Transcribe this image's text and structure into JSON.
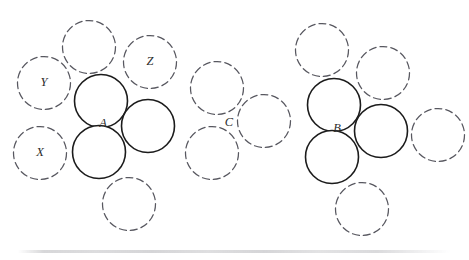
{
  "figure": {
    "canvas": {
      "width": 469,
      "height": 260,
      "background": "#ffffff"
    },
    "style": {
      "solid_stroke_color": "#1c1c1c",
      "solid_stroke_width": 1.6,
      "dashed_stroke_color": "#585860",
      "dashed_stroke_width": 1.25,
      "dash_pattern": "7 4",
      "label_color": "#2b2b2b",
      "label_font_size": 12.5
    },
    "labels": [
      {
        "id": "label-a",
        "text": "A",
        "x": 103,
        "y": 124
      },
      {
        "id": "label-b",
        "text": "B",
        "x": 337,
        "y": 129
      },
      {
        "id": "label-c",
        "text": "C",
        "x": 229,
        "y": 123
      },
      {
        "id": "label-x",
        "text": "X",
        "x": 40,
        "y": 153
      },
      {
        "id": "label-y",
        "text": "Y",
        "x": 44,
        "y": 83
      },
      {
        "id": "label-z",
        "text": "Z",
        "x": 150,
        "y": 62
      }
    ],
    "solid_circles": [
      {
        "id": "solid-a-upper-left",
        "cx": 101,
        "cy": 101,
        "r": 26.5
      },
      {
        "id": "solid-a-right",
        "cx": 148,
        "cy": 126,
        "r": 26.5
      },
      {
        "id": "solid-a-lower-left",
        "cx": 99,
        "cy": 152,
        "r": 26.5
      },
      {
        "id": "solid-b-upper-left",
        "cx": 334,
        "cy": 105,
        "r": 26.5
      },
      {
        "id": "solid-b-right",
        "cx": 381,
        "cy": 131,
        "r": 26.5
      },
      {
        "id": "solid-b-lower-left",
        "cx": 332,
        "cy": 157,
        "r": 26.5
      }
    ],
    "dashed_circles": [
      {
        "id": "dashed-top-left",
        "cx": 89,
        "cy": 47,
        "r": 26.5
      },
      {
        "id": "dashed-z",
        "cx": 150,
        "cy": 62,
        "r": 26.5
      },
      {
        "id": "dashed-y",
        "cx": 44,
        "cy": 83,
        "r": 26.5
      },
      {
        "id": "dashed-x",
        "cx": 40,
        "cy": 153,
        "r": 26.5
      },
      {
        "id": "dashed-left-bottom",
        "cx": 129,
        "cy": 204,
        "r": 26.5
      },
      {
        "id": "dashed-mid-upper",
        "cx": 217,
        "cy": 88,
        "r": 26.5
      },
      {
        "id": "dashed-mid-right",
        "cx": 264,
        "cy": 121,
        "r": 26.5
      },
      {
        "id": "dashed-mid-lower",
        "cx": 212,
        "cy": 153,
        "r": 26.5
      },
      {
        "id": "dashed-right-top-left",
        "cx": 322,
        "cy": 50,
        "r": 26.5
      },
      {
        "id": "dashed-right-top-right",
        "cx": 383,
        "cy": 73,
        "r": 26.5
      },
      {
        "id": "dashed-right-far",
        "cx": 438,
        "cy": 135,
        "r": 26.5
      },
      {
        "id": "dashed-right-bottom",
        "cx": 362,
        "cy": 209,
        "r": 26.5
      }
    ]
  }
}
